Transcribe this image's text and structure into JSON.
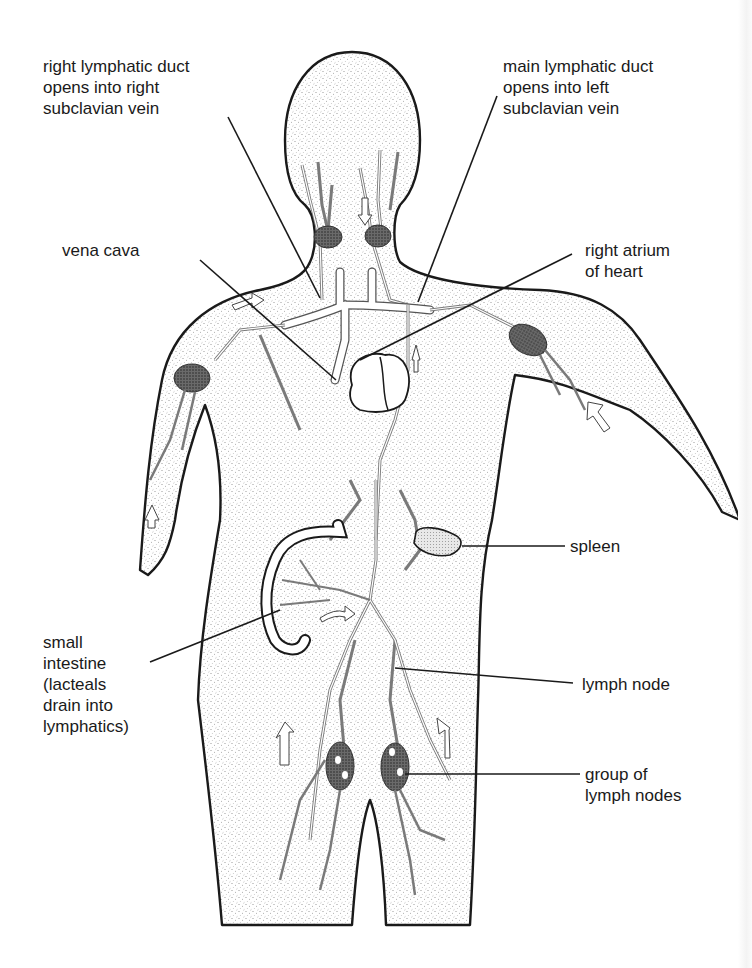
{
  "figure": {
    "labels": [
      {
        "id": "right-lymphatic-duct",
        "lines": [
          "right lymphatic duct",
          "opens into right",
          "subclavian vein"
        ]
      },
      {
        "id": "main-lymphatic-duct",
        "lines": [
          "main lymphatic duct",
          "opens into left",
          "subclavian vein"
        ]
      },
      {
        "id": "vena-cava",
        "lines": [
          "vena cava"
        ]
      },
      {
        "id": "right-atrium",
        "lines": [
          "right atrium",
          "of heart"
        ]
      },
      {
        "id": "spleen",
        "lines": [
          "spleen"
        ]
      },
      {
        "id": "small-intestine",
        "lines": [
          "small",
          "intestine",
          "(lacteals",
          "drain into",
          "lymphatics)"
        ]
      },
      {
        "id": "lymph-node",
        "lines": [
          "lymph node"
        ]
      },
      {
        "id": "group-of-lymph-nodes",
        "lines": [
          "group of",
          "lymph nodes"
        ]
      }
    ],
    "colors": {
      "outline": "#1a1a1a",
      "stipple": "#8a8a8a",
      "vessel_fill": "#ffffff",
      "vessel_stroke": "#7a7a7a",
      "node_fill": "#4a4a4a",
      "background": "#ffffff"
    }
  }
}
